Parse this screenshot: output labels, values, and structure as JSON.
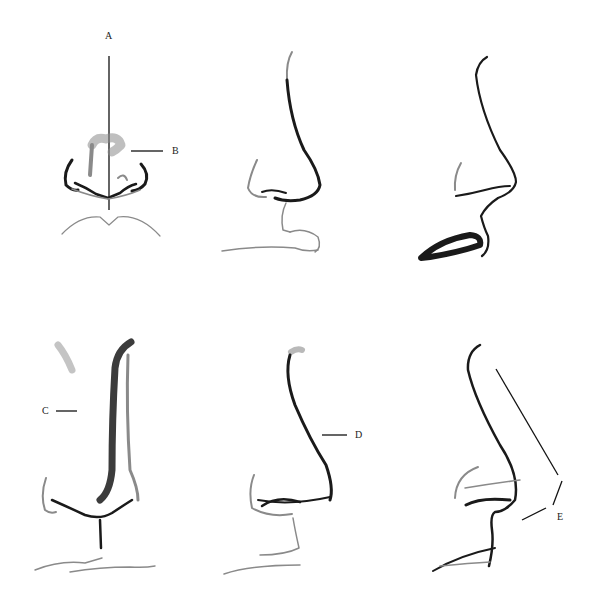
{
  "diagram": {
    "type": "anatomical sketch sheet",
    "layout": {
      "rows": 2,
      "columns": 3
    },
    "panels": [
      {
        "row": 1,
        "col": 1,
        "view": "front",
        "labels": [
          "A",
          "B"
        ]
      },
      {
        "row": 1,
        "col": 2,
        "view": "three-quarter",
        "labels": []
      },
      {
        "row": 1,
        "col": 3,
        "view": "profile",
        "labels": []
      },
      {
        "row": 2,
        "col": 1,
        "view": "front-three-quarter",
        "labels": [
          "C"
        ]
      },
      {
        "row": 2,
        "col": 2,
        "view": "three-quarter",
        "labels": [
          "D"
        ]
      },
      {
        "row": 2,
        "col": 3,
        "view": "profile",
        "labels": [
          "E"
        ]
      }
    ],
    "labels": {
      "a": "A",
      "b": "B",
      "c": "C",
      "d": "D",
      "e": "E"
    },
    "colors": {
      "background": "#ffffff",
      "ink": "#1a1a1a",
      "shading": "#8a8a8a"
    }
  }
}
